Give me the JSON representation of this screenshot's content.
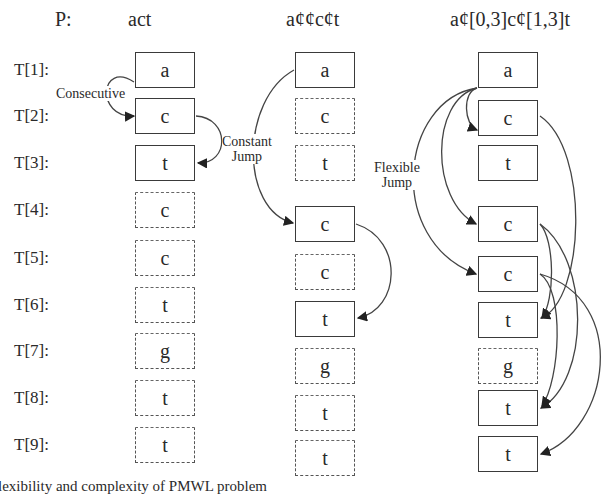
{
  "header": {
    "p_label": "P:",
    "patterns": [
      "act",
      "a¢¢c¢t",
      "a¢[0,3]c¢[1,3]t"
    ]
  },
  "rows": [
    "T[1]:",
    "T[2]:",
    "T[3]:",
    "T[4]:",
    "T[5]:",
    "T[6]:",
    "T[7]:",
    "T[8]:",
    "T[9]:"
  ],
  "sequence": [
    "a",
    "c",
    "t",
    "c",
    "c",
    "t",
    "g",
    "t",
    "t"
  ],
  "columns": [
    {
      "pattern": "act",
      "jump_type": "Consecutive",
      "matched": [
        true,
        true,
        true,
        false,
        false,
        false,
        false,
        false,
        false
      ]
    },
    {
      "pattern": "a¢¢c¢t",
      "jump_type": "Constant Jump",
      "matched": [
        true,
        false,
        false,
        true,
        false,
        true,
        false,
        false,
        false
      ]
    },
    {
      "pattern": "a¢[0,3]c¢[1,3]t",
      "jump_type": "Flexible Jump",
      "matched": [
        true,
        true,
        true,
        true,
        true,
        true,
        false,
        true,
        true
      ]
    }
  ],
  "annotations": {
    "consecutive": "Consecutive",
    "constant_line1": "Constant",
    "constant_line2": "Jump",
    "flexible_line1": "Flexible",
    "flexible_line2": "Jump"
  },
  "caption": "lexibility and complexity of PMWL problem"
}
